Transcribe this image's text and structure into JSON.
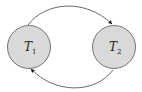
{
  "diagram": {
    "type": "state-transition",
    "colors": {
      "node_fill": "#d9d9d9",
      "node_stroke": "#555555",
      "edge_stroke": "#444444",
      "label": "#222222"
    },
    "nodes": [
      {
        "id": "T1",
        "label_main": "T",
        "label_sub": "1"
      },
      {
        "id": "T2",
        "label_main": "T",
        "label_sub": "2"
      }
    ],
    "edges": [
      {
        "from": "T1",
        "to": "T2",
        "route": "top-arc"
      },
      {
        "from": "T2",
        "to": "T1",
        "route": "bottom-arc"
      }
    ]
  }
}
